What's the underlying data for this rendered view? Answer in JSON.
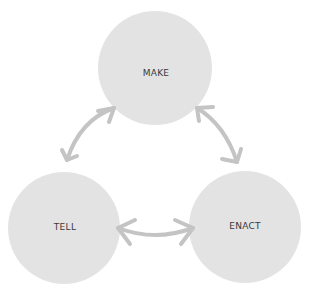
{
  "diagram": {
    "nodes": [
      {
        "id": "make",
        "label": "MAKE",
        "cx": 155,
        "cy": 68,
        "r": 57
      },
      {
        "id": "tell",
        "label": "TELL",
        "cx": 64,
        "cy": 228,
        "r": 56
      },
      {
        "id": "enact",
        "label": "ENACT",
        "cx": 245,
        "cy": 227,
        "r": 56
      }
    ],
    "edges": [
      {
        "from": "make",
        "to": "tell",
        "bidirectional": true
      },
      {
        "from": "make",
        "to": "enact",
        "bidirectional": true
      },
      {
        "from": "tell",
        "to": "enact",
        "bidirectional": true
      }
    ],
    "colors": {
      "circle_fill": "#e3e3e3",
      "arrow": "#c4c4c4",
      "label": "#3a3a3a"
    }
  }
}
